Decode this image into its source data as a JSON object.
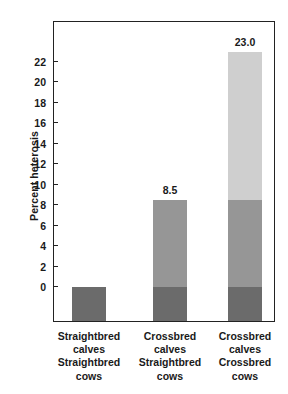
{
  "chart_data": {
    "type": "bar",
    "title": "",
    "xlabel": "",
    "ylabel": "Percent heterosis",
    "ylim": [
      -3.4,
      27.5
    ],
    "grid": false,
    "legend": "none",
    "stacked": true,
    "categories": [
      "Straightbred calves Straightbred cows",
      "Crossbred calves Straightbred cows",
      "Crossbred calves Crossbred cows"
    ],
    "category_lines": [
      [
        "Straightbred",
        "calves",
        "Straightbred",
        "cows"
      ],
      [
        "Crossbred",
        "calves",
        "Straightbred",
        "cows"
      ],
      [
        "Crossbred",
        "calves",
        "Crossbred",
        "cows"
      ]
    ],
    "yticks": [
      0,
      2,
      4,
      6,
      8,
      10,
      12,
      14,
      16,
      18,
      20,
      22
    ],
    "ytick_labels": [
      "0",
      "2",
      "4",
      "6",
      "8",
      "10",
      "12",
      "14",
      "16",
      "18",
      "20",
      "22"
    ],
    "values": [
      0.0,
      8.5,
      23.0
    ],
    "value_labels": [
      "",
      "8.5",
      "23.0"
    ],
    "series": [
      {
        "name": "individual-heterosis",
        "values": [
          0.0,
          8.5,
          8.5
        ]
      },
      {
        "name": "maternal-heterosis",
        "values": [
          0.0,
          0.0,
          14.5
        ]
      }
    ],
    "colors": {
      "light": "#cfcfcf",
      "mid": "#969696",
      "dark": "#6b6b6b",
      "axis": "#222222",
      "text": "#1a1a1a",
      "background": "#ffffff"
    }
  }
}
